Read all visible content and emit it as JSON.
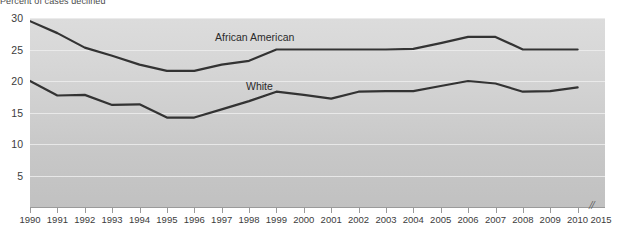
{
  "title": "Percent of cases declined",
  "chart_data": {
    "type": "line",
    "title": "Percent of cases declined",
    "xlabel": "",
    "ylabel": "",
    "x": [
      1990,
      1991,
      1992,
      1993,
      1994,
      1995,
      1996,
      1997,
      1998,
      1999,
      2000,
      2001,
      2002,
      2003,
      2004,
      2005,
      2006,
      2007,
      2008,
      2009,
      2010
    ],
    "xlim": [
      1990,
      2010
    ],
    "ylim": [
      0,
      30
    ],
    "grid": true,
    "legend_position": "inline-labels",
    "x_axis_break_after": 2010,
    "x_tick_labels": [
      "1990",
      "1991",
      "1992",
      "1993",
      "1994",
      "1995",
      "1996",
      "1997",
      "1998",
      "1999",
      "2000",
      "2001",
      "2002",
      "2003",
      "2004",
      "2005",
      "2006",
      "2007",
      "2008",
      "2009",
      "2010",
      "2015"
    ],
    "y_tick_labels": [
      "5",
      "10",
      "15",
      "20",
      "25",
      "30"
    ],
    "y_ticks": [
      5,
      10,
      15,
      20,
      25,
      30
    ],
    "series": [
      {
        "name": "African American",
        "color": "#333333",
        "label_x": 1998,
        "values": [
          29.5,
          27.6,
          25.3,
          24.0,
          22.6,
          21.6,
          21.6,
          22.6,
          23.2,
          25.0,
          25.0,
          25.0,
          25.0,
          25.0,
          25.1,
          26.0,
          27.0,
          27.0,
          25.0,
          25.0,
          25.0
        ]
      },
      {
        "name": "White",
        "color": "#333333",
        "label_x": 1999,
        "values": [
          20.0,
          17.7,
          17.8,
          16.2,
          16.3,
          14.2,
          14.2,
          15.5,
          16.8,
          18.3,
          17.8,
          17.2,
          18.3,
          18.4,
          18.4,
          19.2,
          20.0,
          19.6,
          18.3,
          18.4,
          19.0
        ]
      }
    ]
  },
  "axis_break_glyph": "//",
  "colors": {
    "line": "#333333",
    "gridline": "#ededed",
    "panel_top": "#dcdcdc",
    "panel_bottom": "#c1c1c1",
    "axis": "#9a9a9a",
    "text": "#3c3c3c"
  }
}
